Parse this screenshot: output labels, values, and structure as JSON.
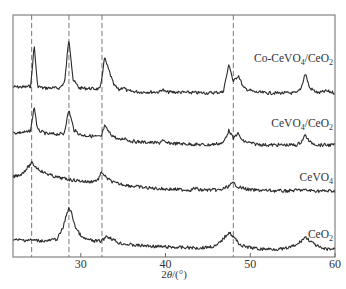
{
  "chart_data": {
    "type": "line",
    "title": "",
    "xlabel": "2θ/(°)",
    "ylabel": "",
    "xlim": [
      22,
      60
    ],
    "xticks": [
      30,
      40,
      50,
      60
    ],
    "grid": false,
    "legend_position": "inline labels at right of each trace",
    "reference_lines_x": [
      24.2,
      28.6,
      32.5,
      48.0
    ],
    "series": [
      {
        "name": "Co-CeVO4/CeO2",
        "label_sub": [
          "Co-CeVO",
          "4",
          "/CeO",
          "2"
        ],
        "baseline": 87,
        "points": [
          [
            22,
            87
          ],
          [
            23.5,
            87
          ],
          [
            24.1,
            86
          ],
          [
            24.5,
            45
          ],
          [
            24.9,
            86
          ],
          [
            25.5,
            88
          ],
          [
            27.5,
            88
          ],
          [
            28.1,
            82
          ],
          [
            28.6,
            38
          ],
          [
            29.1,
            80
          ],
          [
            29.8,
            88
          ],
          [
            32.3,
            89
          ],
          [
            32.8,
            58
          ],
          [
            33.3,
            70
          ],
          [
            33.9,
            85
          ],
          [
            34.5,
            90
          ],
          [
            35.0,
            87
          ],
          [
            35.5,
            91
          ],
          [
            37,
            92
          ],
          [
            39.3,
            92
          ],
          [
            39.6,
            89
          ],
          [
            40,
            92
          ],
          [
            45,
            93
          ],
          [
            46.8,
            92
          ],
          [
            47.5,
            64
          ],
          [
            48.0,
            82
          ],
          [
            48.6,
            75
          ],
          [
            49.2,
            88
          ],
          [
            50.5,
            92
          ],
          [
            52,
            93
          ],
          [
            55.5,
            93
          ],
          [
            56.0,
            88
          ],
          [
            56.5,
            73
          ],
          [
            57.0,
            88
          ],
          [
            58,
            93
          ],
          [
            59,
            91
          ],
          [
            60,
            93
          ]
        ]
      },
      {
        "name": "CeVO4/CeO2",
        "label_sub": [
          "CeVO",
          "4",
          "/CeO",
          "2"
        ],
        "points": [
          [
            22,
            133
          ],
          [
            23.8,
            132
          ],
          [
            24.1,
            130
          ],
          [
            24.5,
            106
          ],
          [
            24.9,
            130
          ],
          [
            26,
            134
          ],
          [
            28.0,
            134
          ],
          [
            28.6,
            110
          ],
          [
            29.2,
            130
          ],
          [
            30,
            135
          ],
          [
            32.4,
            137
          ],
          [
            32.8,
            126
          ],
          [
            33.5,
            134
          ],
          [
            34.5,
            140
          ],
          [
            35.2,
            138
          ],
          [
            35.8,
            141
          ],
          [
            37,
            142
          ],
          [
            39.3,
            143
          ],
          [
            39.6,
            140
          ],
          [
            40,
            143
          ],
          [
            45,
            145
          ],
          [
            46.8,
            143
          ],
          [
            47.5,
            130
          ],
          [
            48.0,
            139
          ],
          [
            48.5,
            133
          ],
          [
            49.1,
            141
          ],
          [
            50.5,
            144
          ],
          [
            52,
            145
          ],
          [
            55.5,
            145
          ],
          [
            56.0,
            142
          ],
          [
            56.5,
            135
          ],
          [
            57.0,
            142
          ],
          [
            58,
            145
          ],
          [
            60,
            145
          ]
        ]
      },
      {
        "name": "CeVO4",
        "label_sub": [
          "CeVO",
          "4",
          "",
          ""
        ],
        "points": [
          [
            22,
            177
          ],
          [
            23.0,
            174
          ],
          [
            23.8,
            167
          ],
          [
            24.2,
            163
          ],
          [
            24.7,
            167
          ],
          [
            25.5,
            172
          ],
          [
            27,
            177
          ],
          [
            29,
            180
          ],
          [
            31,
            182
          ],
          [
            32.0,
            180
          ],
          [
            32.5,
            172
          ],
          [
            33.0,
            178
          ],
          [
            34,
            183
          ],
          [
            36,
            186
          ],
          [
            38,
            188
          ],
          [
            40,
            189
          ],
          [
            43,
            190
          ],
          [
            43.5,
            188
          ],
          [
            44,
            190
          ],
          [
            46.5,
            190
          ],
          [
            47.5,
            186
          ],
          [
            48.0,
            183
          ],
          [
            48.6,
            187
          ],
          [
            50,
            190
          ],
          [
            54,
            191
          ],
          [
            56,
            190
          ],
          [
            58,
            191
          ],
          [
            60,
            191
          ]
        ]
      },
      {
        "name": "CeO2",
        "label_sub": [
          "CeO",
          "2",
          "",
          ""
        ],
        "points": [
          [
            22,
            240
          ],
          [
            24,
            240
          ],
          [
            26,
            241
          ],
          [
            27.2,
            239
          ],
          [
            27.9,
            228
          ],
          [
            28.4,
            212
          ],
          [
            28.6,
            208
          ],
          [
            28.9,
            213
          ],
          [
            29.4,
            228
          ],
          [
            30.2,
            238
          ],
          [
            31.5,
            241
          ],
          [
            32.5,
            241
          ],
          [
            33.0,
            236
          ],
          [
            33.5,
            238
          ],
          [
            34.5,
            243
          ],
          [
            36,
            245
          ],
          [
            40,
            247
          ],
          [
            44,
            248
          ],
          [
            46.0,
            246
          ],
          [
            46.9,
            238
          ],
          [
            47.5,
            232
          ],
          [
            48.1,
            238
          ],
          [
            49,
            246
          ],
          [
            51,
            249
          ],
          [
            54,
            249
          ],
          [
            55.5,
            245
          ],
          [
            56.5,
            237
          ],
          [
            57.5,
            244
          ],
          [
            58.5,
            249
          ],
          [
            60,
            249
          ]
        ]
      }
    ]
  },
  "axis": {
    "tick_labels": [
      "30",
      "40",
      "50",
      "60"
    ],
    "xlabel_text": "2θ/(°)"
  }
}
